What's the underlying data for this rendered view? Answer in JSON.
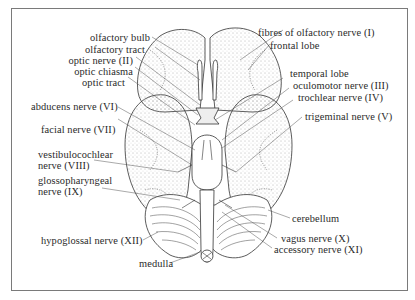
{
  "diagram": {
    "labels_left": [
      {
        "id": "olfactory-bulb",
        "text": "olfactory bulb"
      },
      {
        "id": "olfactory-tract",
        "text": "olfactory tract"
      },
      {
        "id": "optic-nerve",
        "text": "optic nerve (II)"
      },
      {
        "id": "optic-chiasma",
        "text": "optic chiasma"
      },
      {
        "id": "optic-tract",
        "text": "optic tract"
      },
      {
        "id": "abducens-nerve",
        "text": "abducens nerve (VI)"
      },
      {
        "id": "facial-nerve",
        "text": "facial nerve (VII)"
      },
      {
        "id": "vestibulocochlear-nerve",
        "text": "vestibulocochlear\nnerve (VIII)",
        "line1": "vestibulocochlear",
        "line2": "nerve (VIII)"
      },
      {
        "id": "glossopharyngeal-nerve",
        "text": "glossopharyngeal\nnerve (IX)",
        "line1": "glossopharyngeal",
        "line2": "nerve (IX)"
      },
      {
        "id": "hypoglossal-nerve",
        "text": "hypoglossal nerve (XII)"
      },
      {
        "id": "medulla",
        "text": "medulla"
      }
    ],
    "labels_right": [
      {
        "id": "fibres-olfactory-nerve",
        "text": "fibres of olfactory nerve (I)"
      },
      {
        "id": "frontal-lobe",
        "text": "frontal lobe"
      },
      {
        "id": "temporal-lobe",
        "text": "temporal lobe"
      },
      {
        "id": "oculomotor-nerve",
        "text": "oculomotor nerve (III)"
      },
      {
        "id": "trochlear-nerve",
        "text": "trochlear nerve (IV)"
      },
      {
        "id": "trigeminal-nerve",
        "text": "trigeminal nerve (V)"
      },
      {
        "id": "cerebellum",
        "text": "cerebellum"
      },
      {
        "id": "vagus-nerve",
        "text": "vagus nerve (X)"
      },
      {
        "id": "accessory-nerve",
        "text": "accessory nerve (XI)"
      }
    ],
    "colors": {
      "frame": "#7a7a7a",
      "ink": "#2a2a2a",
      "stipple": "#555555",
      "background": "#ffffff"
    }
  }
}
